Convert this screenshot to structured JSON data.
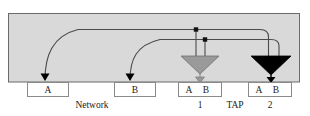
{
  "diagram": {
    "colors": {
      "fabric_fill": "#d9d9d9",
      "fabric_stroke": "#6b6b6b",
      "box_fill": "#ffffff",
      "box_stroke": "#8a8a8a",
      "trace_stroke": "#4a4a4a",
      "tap1_triangle": "#9a9a9a",
      "tap2_triangle": "#000000",
      "connector_triangle": "#000000",
      "text": "#1a1a1a"
    },
    "fabric": {
      "name": "network-fabric-region"
    },
    "connectors": [
      {
        "id": "net-a",
        "label": "A",
        "caption_group": "Network"
      },
      {
        "id": "net-b",
        "label": "B",
        "caption_group": "Network"
      }
    ],
    "taps": [
      {
        "id": "tap-1",
        "number": "1",
        "port_a": "A",
        "port_b": "B",
        "arrow_color": "#9a9a9a"
      },
      {
        "id": "tap-2",
        "number": "2",
        "port_a": "A",
        "port_b": "B",
        "arrow_color": "#000000"
      }
    ],
    "captions": {
      "network": "Network",
      "tap": "TAP"
    }
  }
}
